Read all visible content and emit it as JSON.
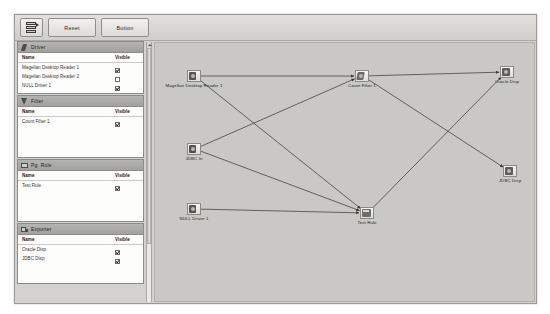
{
  "toolbar": {
    "icon_button_name": "layers-icon-button",
    "buttons": [
      {
        "label": "Reset",
        "name": "reset-button"
      },
      {
        "label": "Button",
        "name": "button-button"
      }
    ]
  },
  "sidebar": {
    "columns": {
      "name": "Name",
      "visible": "Visible"
    },
    "panels": [
      {
        "title": "Driver",
        "icon": "driver-icon",
        "rows": [
          {
            "name": "Magellan Desktop Reader 1",
            "visible": true
          },
          {
            "name": "Magellan Desktop Reader 2",
            "visible": false
          },
          {
            "name": "NULL Driver 1",
            "visible": true
          }
        ]
      },
      {
        "title": "Filter",
        "icon": "filter-icon",
        "rows": [
          {
            "name": "Count Filter 1",
            "visible": true
          }
        ]
      },
      {
        "title": "Pg. Rule",
        "icon": "rule-icon",
        "rows": [
          {
            "name": "Test Rule",
            "visible": true
          }
        ]
      },
      {
        "title": "Exporter",
        "icon": "exporter-icon",
        "rows": [
          {
            "name": "Oracle Disp",
            "visible": true
          },
          {
            "name": "JDBC Disp",
            "visible": true
          }
        ]
      }
    ]
  },
  "canvas": {
    "nodes": [
      {
        "id": "reader1",
        "label": "Magellan Desktop Reader 1",
        "type": "driver",
        "x": 32,
        "y": 27
      },
      {
        "id": "jdbcin",
        "label": "JDBC In",
        "type": "driver",
        "x": 32,
        "y": 100
      },
      {
        "id": "nulldrv",
        "label": "NULL Driver 1",
        "type": "driver",
        "x": 32,
        "y": 160
      },
      {
        "id": "cfilter",
        "label": "Count Filter 1",
        "type": "filter",
        "x": 200,
        "y": 27
      },
      {
        "id": "testrule",
        "label": "Test Rule",
        "type": "rule",
        "x": 205,
        "y": 164
      },
      {
        "id": "oracle",
        "label": "Oracle Disp",
        "type": "exporter",
        "x": 345,
        "y": 23
      },
      {
        "id": "jdbcdisp",
        "label": "JDBC Disp",
        "type": "exporter",
        "x": 348,
        "y": 122
      }
    ],
    "edges": [
      {
        "from": "reader1",
        "to": "cfilter"
      },
      {
        "from": "reader1",
        "to": "testrule"
      },
      {
        "from": "jdbcin",
        "to": "cfilter"
      },
      {
        "from": "jdbcin",
        "to": "testrule"
      },
      {
        "from": "nulldrv",
        "to": "testrule"
      },
      {
        "from": "cfilter",
        "to": "oracle"
      },
      {
        "from": "cfilter",
        "to": "jdbcdisp"
      },
      {
        "from": "testrule",
        "to": "oracle"
      }
    ]
  },
  "scrollbar": {
    "name": "sidebar-vertical-scrollbar"
  }
}
